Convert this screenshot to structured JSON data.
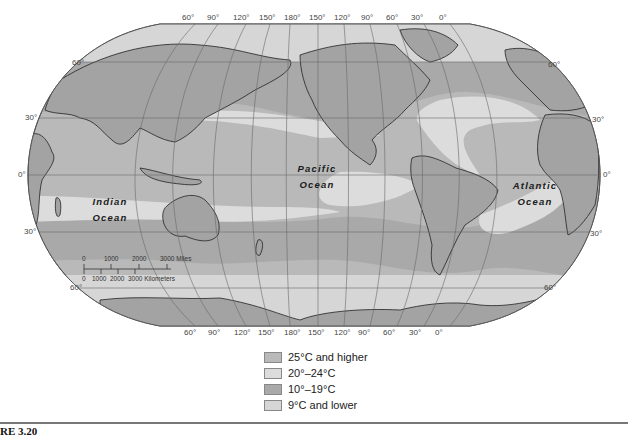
{
  "map": {
    "title": "Ocean surface temperatures",
    "projection": "Robinson (Pacific-centered)",
    "colors": {
      "land": "#a3a3a3",
      "temp_25_higher": "#b9b9b9",
      "temp_20_24": "#dcdcdc",
      "temp_10_19": "#a9a9a9",
      "temp_9_lower": "#d6d6d6",
      "grid": "#6a6a6a",
      "coast": "#222222"
    },
    "longitude_labels_top": [
      "60°",
      "90°",
      "120°",
      "150°",
      "180°",
      "150°",
      "120°",
      "90°",
      "60°",
      "30°",
      "0°"
    ],
    "longitude_labels_bottom": [
      "60°",
      "90°",
      "120°",
      "150°",
      "180°",
      "150°",
      "120°",
      "90°",
      "60°",
      "30°",
      "0°"
    ],
    "latitude_labels_left": [
      "60°",
      "30°",
      "0°",
      "30°",
      "60°"
    ],
    "latitude_labels_right": [
      "60°",
      "30°",
      "0°",
      "30°",
      "60°"
    ],
    "ocean_labels": {
      "indian": [
        "Indian",
        "Ocean"
      ],
      "pacific": [
        "Pacific",
        "Ocean"
      ],
      "atlantic": [
        "Atlantic",
        "Ocean"
      ]
    },
    "scale_bar": {
      "miles_ticks": [
        "0",
        "1000",
        "2000",
        "3000 Miles"
      ],
      "km_ticks": [
        "0",
        "1000",
        "2000",
        "3000 Kilometers"
      ]
    }
  },
  "legend": {
    "items": [
      {
        "label": "25°C and higher",
        "color": "#b9b9b9"
      },
      {
        "label": "20°–24°C",
        "color": "#dcdcdc"
      },
      {
        "label": "10°–19°C",
        "color": "#a9a9a9"
      },
      {
        "label": "9°C and lower",
        "color": "#d6d6d6"
      }
    ]
  },
  "caption": {
    "figure_number": "RE 3.20"
  }
}
